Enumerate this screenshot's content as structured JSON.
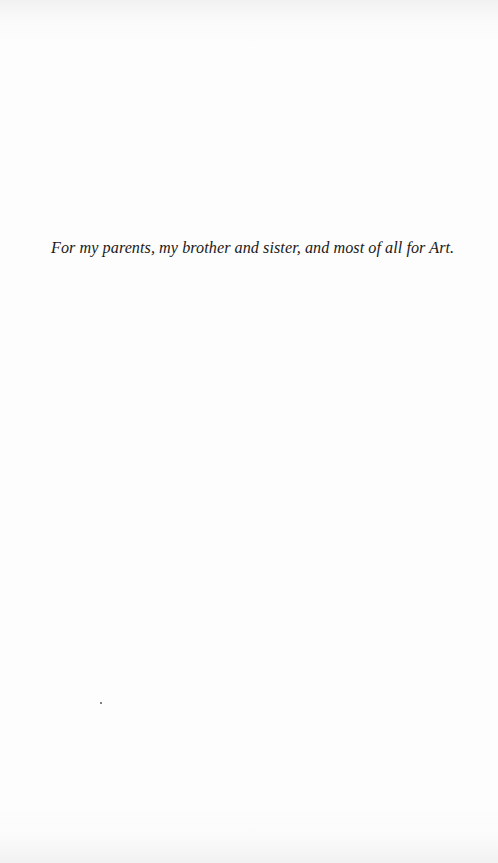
{
  "page": {
    "type": "dedication",
    "dedication_text": "For my parents, my brother and sister, and most of all for Art."
  }
}
